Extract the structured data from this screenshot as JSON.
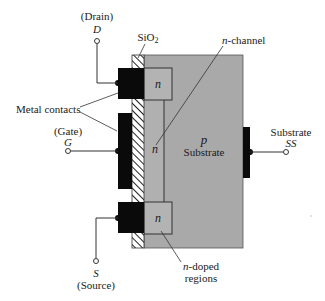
{
  "figure": {
    "colors": {
      "body": "#a9a9a9",
      "n_region": "#b3b3b3",
      "metal": "#0a0a0a",
      "oxide_bg": "#ffffff",
      "oxide_hatch": "#222222",
      "wire": "#333333",
      "text": "#1a1a1a"
    }
  },
  "labels": {
    "drain_paren": "(Drain)",
    "drain_sym": "D",
    "gate_paren": "(Gate)",
    "gate_sym": "G",
    "source_sym": "S",
    "source_paren": "(Source)",
    "sio2_main": "SiO",
    "sio2_sub": "2",
    "metal_contacts": "Metal contacts",
    "n_channel_italic": "n",
    "n_channel_rest": "-channel",
    "n_top": "n",
    "n_mid": "n",
    "n_bottom": "n",
    "p_sym": "p",
    "p_substrate": "Substrate",
    "substrate_label": "Substrate",
    "substrate_sym": "SS",
    "n_doped_italic": "n",
    "n_doped_rest": "-doped",
    "n_doped_line2": "regions"
  }
}
